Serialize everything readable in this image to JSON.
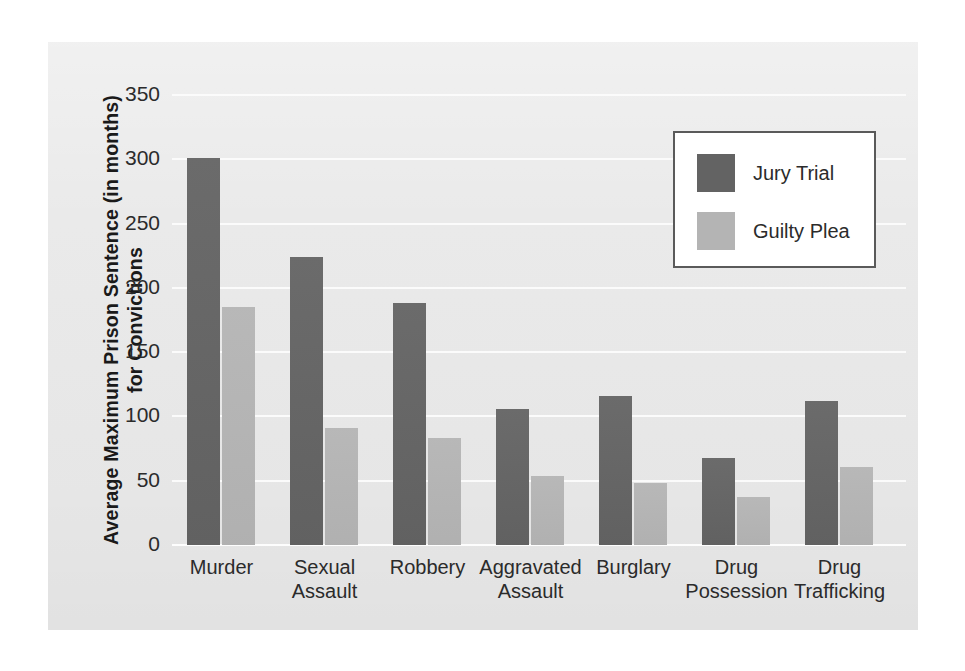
{
  "chart_data": {
    "type": "bar",
    "title": "",
    "xlabel": "",
    "ylabel": "Average Maximum Prison Sentence (in months) for Convictions",
    "ylabel_line1": "Average Maximum Prison Sentence (in months)",
    "ylabel_line2": "for Convictions",
    "ylim": [
      0,
      350
    ],
    "ytick_values": [
      0,
      50,
      100,
      150,
      200,
      250,
      300,
      350
    ],
    "ytick_labels": [
      "0",
      "50",
      "100",
      "150",
      "200",
      "250",
      "300",
      "350"
    ],
    "grid": true,
    "grid_orientation": "horizontal",
    "legend_position": "upper right",
    "categories": [
      "Murder",
      "Sexual Assault",
      "Robbery",
      "Aggravated Assault",
      "Burglary",
      "Drug Possession",
      "Drug Trafficking"
    ],
    "category_lines": [
      [
        "Murder"
      ],
      [
        "Sexual",
        "Assault"
      ],
      [
        "Robbery"
      ],
      [
        "Aggravated",
        "Assault"
      ],
      [
        "Burglary"
      ],
      [
        "Drug",
        "Possession"
      ],
      [
        "Drug",
        "Trafficking"
      ]
    ],
    "series": [
      {
        "name": "Jury Trial",
        "color": "#636363",
        "values": [
          301,
          224,
          188,
          106,
          116,
          68,
          112
        ]
      },
      {
        "name": "Guilty Plea",
        "color": "#b4b4b4",
        "values": [
          185,
          91,
          83,
          54,
          48,
          37,
          61
        ]
      }
    ]
  },
  "legend": {
    "entries": [
      {
        "label": "Jury Trial",
        "color": "#636363"
      },
      {
        "label": "Guilty Plea",
        "color": "#b4b4b4"
      }
    ]
  },
  "colors": {
    "panel_background": "#e9e9e9",
    "page_background": "#ffffff",
    "gridline": "#fbfbfb",
    "text": "#2b2b2b",
    "legend_border": "#5a5a5a",
    "series_dark": "#636363",
    "series_light": "#b4b4b4"
  }
}
